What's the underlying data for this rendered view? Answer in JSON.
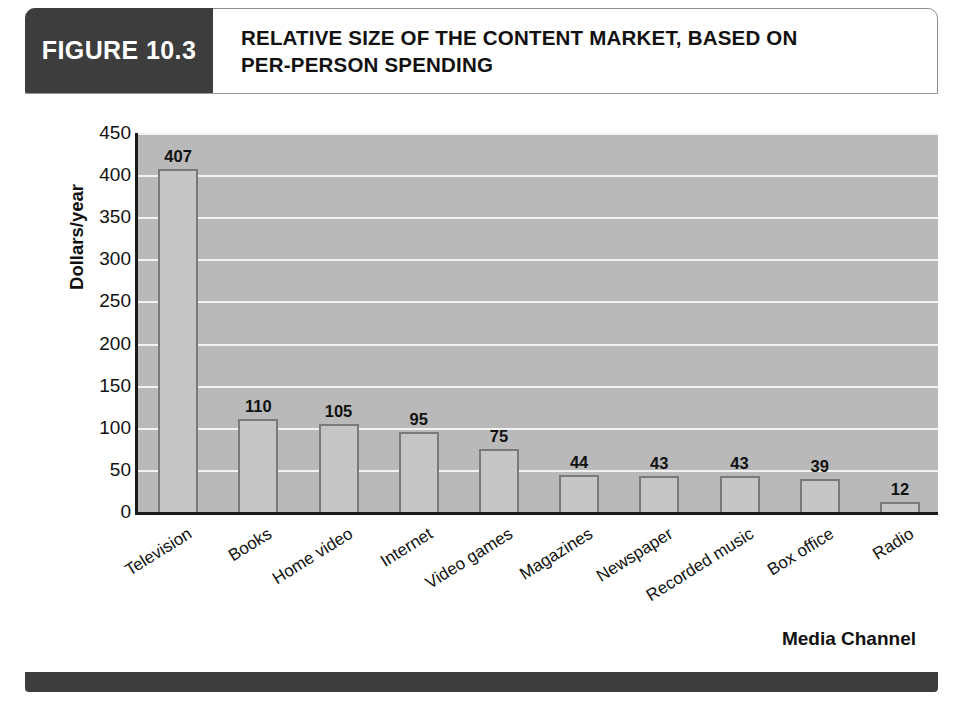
{
  "figure": {
    "tag": "FIGURE 10.3",
    "title_line1": "RELATIVE SIZE OF THE CONTENT MARKET, BASED ON",
    "title_line2": "PER-PERSON SPENDING",
    "tag_bg_color": "#3d3d3d",
    "tag_text_color": "#ffffff",
    "footer_color": "#3d3d3d",
    "frame_border_color": "#8d8d8d"
  },
  "chart_data": {
    "type": "bar",
    "title": "RELATIVE SIZE OF THE CONTENT MARKET, BASED ON PER-PERSON SPENDING",
    "xlabel": "Media Channel",
    "ylabel": "Dollars/year",
    "ylim": [
      0,
      450
    ],
    "ytick_step": 50,
    "yticks": [
      "450",
      "400",
      "350",
      "300",
      "250",
      "200",
      "150",
      "100",
      "50",
      "0"
    ],
    "ytick_values": [
      450,
      400,
      350,
      300,
      250,
      200,
      150,
      100,
      50,
      0
    ],
    "grid": true,
    "grid_axis": "y",
    "legend": false,
    "categories": [
      "Television",
      "Books",
      "Home video",
      "Internet",
      "Video games",
      "Magazines",
      "Newspaper",
      "Recorded music",
      "Box office",
      "Radio"
    ],
    "values": [
      407,
      110,
      105,
      95,
      75,
      44,
      43,
      43,
      39,
      12
    ],
    "value_labels": [
      "407",
      "110",
      "105",
      "95",
      "75",
      "44",
      "43",
      "43",
      "39",
      "12"
    ],
    "plot_bg_color": "#b9b9b9",
    "bar_fill_color": "#c6c6c6",
    "bar_border_color": "#7a7a7a",
    "gridline_color": "#f2f2f2",
    "axis_color": "#1a1a1a"
  }
}
